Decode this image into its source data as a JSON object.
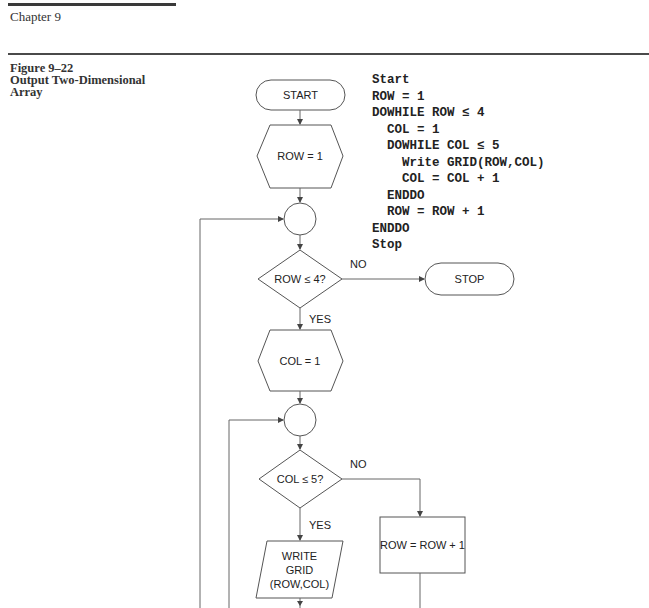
{
  "header": {
    "chapter": "Chapter 9"
  },
  "figure": {
    "number": "Figure 9–22",
    "title_line1": "Output Two-Dimensional",
    "title_line2": "Array"
  },
  "pseudocode": {
    "lines": [
      "Start",
      "ROW = 1",
      "DOWHILE ROW ≤ 4",
      "  COL = 1",
      "  DOWHILE COL ≤ 5",
      "    Write GRID(ROW,COL)",
      "    COL = COL + 1",
      "  ENDDO",
      "  ROW = ROW + 1",
      "ENDDO",
      "Stop"
    ]
  },
  "flowchart": {
    "start": "START",
    "init_row": "ROW = 1",
    "row_test": "ROW ≤ 4?",
    "row_no": "NO",
    "row_yes": "YES",
    "stop": "STOP",
    "init_col": "COL = 1",
    "col_test": "COL ≤ 5?",
    "col_no": "NO",
    "col_yes": "YES",
    "write_line1": "WRITE",
    "write_line2": "GRID",
    "write_line3": "(ROW,COL)",
    "row_increment": "ROW = ROW + 1"
  }
}
